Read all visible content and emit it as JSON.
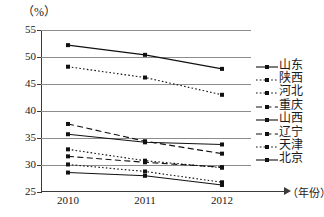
{
  "chart_data": {
    "type": "line",
    "title": "",
    "xlabel": "（年份）",
    "ylabel": "（%）",
    "ylim": [
      25,
      55
    ],
    "yticks": [
      25,
      30,
      35,
      40,
      45,
      50,
      55
    ],
    "grid": true,
    "legend_position": "right",
    "categories": [
      "2010",
      "2011",
      "2012"
    ],
    "x": [
      2010,
      2011,
      2012
    ],
    "series": [
      {
        "name": "山东",
        "style": "solid",
        "values": [
          52.2,
          50.4,
          47.8
        ]
      },
      {
        "name": "陕西",
        "style": "dotted",
        "values": [
          48.2,
          46.2,
          43.0
        ]
      },
      {
        "name": "河北",
        "style": "dotted",
        "values": [
          32.9,
          30.8,
          29.5
        ]
      },
      {
        "name": "重庆",
        "style": "dashed",
        "values": [
          37.6,
          34.4,
          32.1
        ]
      },
      {
        "name": "山西",
        "style": "solid",
        "values": [
          35.7,
          34.2,
          33.8
        ]
      },
      {
        "name": "辽宁",
        "style": "dashed",
        "values": [
          31.6,
          30.5,
          29.6
        ]
      },
      {
        "name": "天津",
        "style": "dotted",
        "values": [
          30.1,
          28.8,
          26.8
        ]
      },
      {
        "name": "北京",
        "style": "solid",
        "values": [
          28.6,
          28.0,
          26.3
        ]
      }
    ]
  },
  "axes": {
    "unit_label": "（%）",
    "x_axis_title": "（年份）",
    "y_tick_labels": [
      "55",
      "50",
      "45",
      "40",
      "35",
      "30",
      "25"
    ],
    "x_tick_labels": [
      "2010",
      "2011",
      "2012"
    ]
  },
  "legend": {
    "items": [
      {
        "label": "山东"
      },
      {
        "label": "陕西"
      },
      {
        "label": "河北"
      },
      {
        "label": "重庆"
      },
      {
        "label": "山西"
      },
      {
        "label": "辽宁"
      },
      {
        "label": "天津"
      },
      {
        "label": "北京"
      }
    ]
  },
  "colors": {
    "line": "#111111",
    "grid": "#8c8c8c",
    "axis": "#3a3a3a",
    "background": "#ffffff"
  }
}
